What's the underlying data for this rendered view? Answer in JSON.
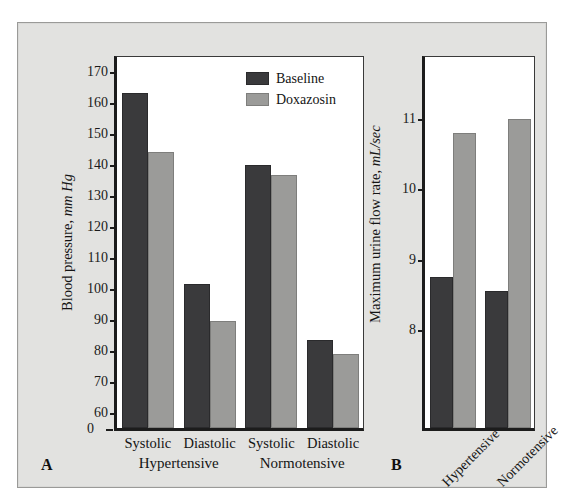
{
  "figure": {
    "background_color": "#e2e2e0",
    "plot_background": "#ffffff",
    "baseline_color": "#3a3a3c",
    "treatment_color": "#9b9b99"
  },
  "legend": {
    "items": [
      {
        "label": "Baseline",
        "color": "#3a3a3c"
      },
      {
        "label": "Doxazosin",
        "color": "#9b9b99"
      }
    ]
  },
  "panels": {
    "a": {
      "letter": "A"
    },
    "b": {
      "letter": "B"
    }
  },
  "chart_data": [
    {
      "type": "bar",
      "panel": "A",
      "title": "",
      "xlabel": "",
      "ylabel": "Blood pressure, mm Hg",
      "ylabel_plain": "Blood pressure,",
      "ylabel_italic": "mm Hg",
      "ylim": [
        55,
        175
      ],
      "yticks": [
        60,
        70,
        80,
        90,
        100,
        110,
        120,
        130,
        140,
        150,
        160,
        170
      ],
      "ytick_labels": [
        "60",
        "70",
        "80",
        "90",
        "100",
        "110",
        "120",
        "130",
        "140",
        "150",
        "160",
        "170"
      ],
      "axis_break_zero_label": "0",
      "grid": false,
      "legend_position": "top-right",
      "categories": [
        "Systolic",
        "Diastolic",
        "Systolic",
        "Diastolic"
      ],
      "groups": [
        {
          "name": "Hypertensive",
          "categories": [
            "Systolic",
            "Diastolic"
          ]
        },
        {
          "name": "Normotensive",
          "categories": [
            "Systolic",
            "Diastolic"
          ]
        }
      ],
      "series": [
        {
          "name": "Baseline",
          "values": [
            163,
            101.5,
            140,
            83.5
          ]
        },
        {
          "name": "Doxazosin",
          "values": [
            144,
            89.5,
            136.5,
            79
          ]
        }
      ]
    },
    {
      "type": "bar",
      "panel": "B",
      "title": "",
      "xlabel": "",
      "ylabel": "Maximum urine flow rate, mL/sec",
      "ylabel_plain": "Maximum urine flow rate,",
      "ylabel_italic": "mL/sec",
      "ylim": [
        6.6,
        11.9
      ],
      "yticks": [
        8,
        9,
        10,
        11
      ],
      "ytick_labels": [
        "8",
        "9",
        "10",
        "11"
      ],
      "grid": false,
      "legend_position": "none",
      "categories": [
        "Hypertensive",
        "Normotensive"
      ],
      "series": [
        {
          "name": "Baseline",
          "values": [
            8.75,
            8.55
          ]
        },
        {
          "name": "Doxazosin",
          "values": [
            10.8,
            11.0
          ]
        }
      ]
    }
  ]
}
